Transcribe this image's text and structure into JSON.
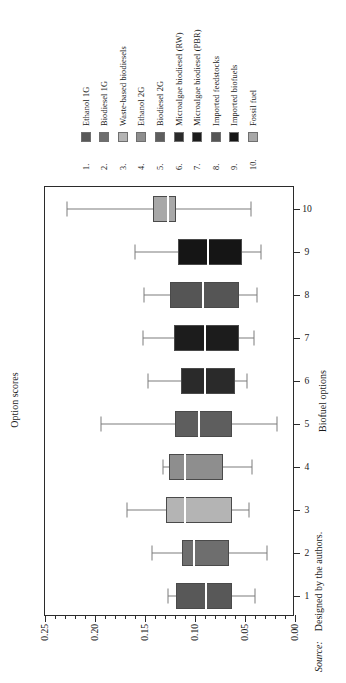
{
  "figure": {
    "orientation": "rotated-90-ccw",
    "source_label": "Source:",
    "source_text": "Designed by the authors."
  },
  "legend": {
    "entries": [
      {
        "num": "1.",
        "label": "Ethanol 1G",
        "color": "#585858"
      },
      {
        "num": "2.",
        "label": "Biodiesel 1G",
        "color": "#6e6e6e"
      },
      {
        "num": "3.",
        "label": "Waste-based biodiesels",
        "color": "#b4b4b4"
      },
      {
        "num": "4.",
        "label": "Ethanol 2G",
        "color": "#8e8e8e"
      },
      {
        "num": "5.",
        "label": "Biodiesel 2G",
        "color": "#5e5e5e"
      },
      {
        "num": "6.",
        "label": "Microalgae biodiesel (RW)",
        "color": "#2a2a2a"
      },
      {
        "num": "7.",
        "label": "Microalgae biodiesel (PBR)",
        "color": "#1c1c1c"
      },
      {
        "num": "8.",
        "label": "Imported feedstocks",
        "color": "#555555"
      },
      {
        "num": "9.",
        "label": "Imported biofuels",
        "color": "#151515"
      },
      {
        "num": "10.",
        "label": "Fossil fuel",
        "color": "#a8a8a8"
      }
    ]
  },
  "chart_data": {
    "type": "box",
    "title": "",
    "xlabel": "Biofuel options",
    "ylabel": "Option scores",
    "ylim": [
      0.0,
      0.25
    ],
    "yticks": [
      0.0,
      0.05,
      0.1,
      0.15,
      0.2,
      0.25
    ],
    "ytick_labels": [
      "0.00",
      "0.05",
      "0.10",
      "0.15",
      "0.20",
      "0.25"
    ],
    "minor_tick_step": 0.01,
    "grid": false,
    "legend_position": "top",
    "categories": [
      "1",
      "2",
      "3",
      "4",
      "5",
      "6",
      "7",
      "8",
      "9",
      "10"
    ],
    "category_labels": [
      "Ethanol 1G",
      "Biodiesel 1G",
      "Waste-based biodiesels",
      "Ethanol 2G",
      "Biodiesel 2G",
      "Microalgae biodiesel (RW)",
      "Microalgae biodiesel (PBR)",
      "Imported feedstocks",
      "Imported biofuels",
      "Fossil fuel"
    ],
    "boxes": [
      {
        "category": "1",
        "label": "Ethanol 1G",
        "whisker_low": 0.04,
        "q1": 0.063,
        "median": 0.089,
        "q3": 0.119,
        "whisker_high": 0.127,
        "color": "#585858"
      },
      {
        "category": "2",
        "label": "Biodiesel 1G",
        "whisker_low": 0.028,
        "q1": 0.066,
        "median": 0.101,
        "q3": 0.113,
        "whisker_high": 0.143,
        "color": "#6e6e6e"
      },
      {
        "category": "3",
        "label": "Waste-based biodiesels",
        "whisker_low": 0.046,
        "q1": 0.063,
        "median": 0.11,
        "q3": 0.129,
        "whisker_high": 0.168,
        "color": "#b4b4b4"
      },
      {
        "category": "4",
        "label": "Ethanol 2G",
        "whisker_low": 0.043,
        "q1": 0.072,
        "median": 0.11,
        "q3": 0.126,
        "whisker_high": 0.132,
        "color": "#8e8e8e"
      },
      {
        "category": "5",
        "label": "Biodiesel 2G",
        "whisker_low": 0.018,
        "q1": 0.063,
        "median": 0.096,
        "q3": 0.12,
        "whisker_high": 0.194,
        "color": "#5e5e5e"
      },
      {
        "category": "6",
        "label": "Microalgae biodiesel (RW)",
        "whisker_low": 0.048,
        "q1": 0.06,
        "median": 0.09,
        "q3": 0.114,
        "whisker_high": 0.147,
        "color": "#2a2a2a"
      },
      {
        "category": "7",
        "label": "Microalgae biodiesel (PBR)",
        "whisker_low": 0.041,
        "q1": 0.056,
        "median": 0.09,
        "q3": 0.121,
        "whisker_high": 0.152,
        "color": "#1c1c1c"
      },
      {
        "category": "8",
        "label": "Imported feedstocks",
        "whisker_low": 0.038,
        "q1": 0.056,
        "median": 0.092,
        "q3": 0.125,
        "whisker_high": 0.151,
        "color": "#555555"
      },
      {
        "category": "9",
        "label": "Imported biofuels",
        "whisker_low": 0.034,
        "q1": 0.053,
        "median": 0.087,
        "q3": 0.117,
        "whisker_high": 0.16,
        "color": "#151515"
      },
      {
        "category": "10",
        "label": "Fossil fuel",
        "whisker_low": 0.044,
        "q1": 0.119,
        "median": 0.127,
        "q3": 0.142,
        "whisker_high": 0.228,
        "color": "#a8a8a8"
      }
    ]
  }
}
